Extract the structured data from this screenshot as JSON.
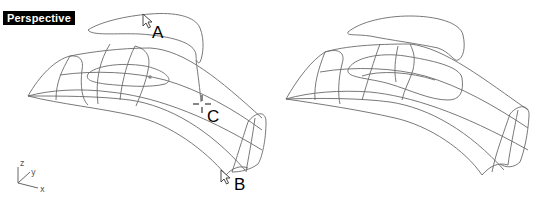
{
  "viewport": {
    "label": "Perspective"
  },
  "callouts": {
    "a": "A",
    "b": "B",
    "c": "C"
  },
  "axis": {
    "x": "x",
    "y": "y",
    "z": "z"
  },
  "icons": {
    "cursor_a": "arrow-cursor-icon",
    "cursor_b": "arrow-cursor-icon",
    "crosshair_c": "crosshair-icon",
    "axis_triad": "world-axis-icon"
  },
  "colors": {
    "background": "#ffffff",
    "wire": "#6a6a6a",
    "label_bg": "#000000",
    "label_fg": "#ffffff"
  }
}
